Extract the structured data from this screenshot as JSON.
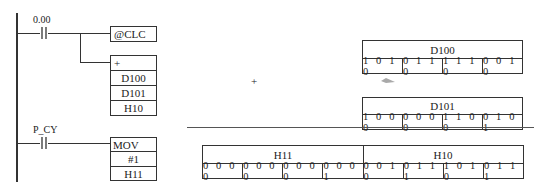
{
  "ladder": {
    "rung1": {
      "contact_label": "0.00",
      "instr1": "@CLC",
      "instr2": {
        "op": "+",
        "operands": [
          "D100",
          "D101",
          "H10"
        ]
      }
    },
    "rung2": {
      "contact_label": "P_CY",
      "instr": {
        "op": "MOV",
        "operands": [
          "#1",
          "H11"
        ]
      }
    }
  },
  "operation_symbol": "+",
  "registers": {
    "d100": {
      "name": "D100",
      "nibbles": [
        "1010",
        "0110",
        "1110",
        "0010"
      ]
    },
    "d101": {
      "name": "D101",
      "nibbles": [
        "1000",
        "0000",
        "1100",
        "0101"
      ]
    },
    "result": {
      "high_name": "H11",
      "low_name": "H10",
      "nibbles": [
        "0000",
        "0000",
        "0000",
        "0001",
        "0010",
        "0111",
        "1010",
        "0111"
      ]
    }
  }
}
